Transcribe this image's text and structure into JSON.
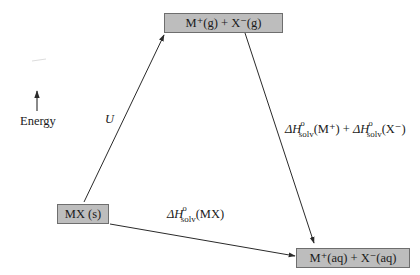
{
  "diagram": {
    "type": "Born-Haber style energy cycle for dissolution of an ionic solid",
    "axis": {
      "label": "Energy",
      "direction": "up"
    },
    "states": {
      "gas_ions": {
        "text": "M⁺(g) + X⁻(g)"
      },
      "solid": {
        "text": "MX (s)"
      },
      "aqueous_ions": {
        "text": "M⁺(aq) + X⁻(aq)"
      }
    },
    "transitions": {
      "lattice": {
        "from": "solid",
        "to": "gas_ions",
        "label": "U"
      },
      "hydration": {
        "from": "gas_ions",
        "to": "aqueous_ions",
        "part1": {
          "symbol": "ΔH",
          "sup": "o",
          "sub": "solv",
          "arg": "(M⁺)"
        },
        "plus": " + ",
        "part2": {
          "symbol": "ΔH",
          "sup": "o",
          "sub": "solv",
          "arg": "(X⁻)"
        }
      },
      "solution": {
        "from": "solid",
        "to": "aqueous_ions",
        "symbol": "ΔH",
        "sup": "o",
        "sub": "solv",
        "arg": "(MX)"
      }
    },
    "colors": {
      "box_fill": "#bdbdbd",
      "box_border": "#6e6e6e",
      "line": "#2a2a2a",
      "background": "#ffffff"
    }
  }
}
